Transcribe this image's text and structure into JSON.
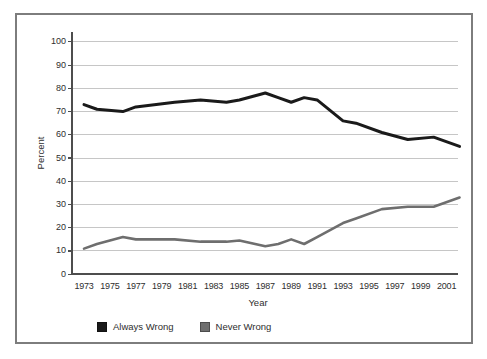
{
  "colors": {
    "background": "#ffffff",
    "frame_border": "#7d7d7d",
    "gridline": "#c6c6c6",
    "axis": "#4d4d4d",
    "text": "#2e2e2e"
  },
  "chart_data": {
    "type": "line",
    "xlabel": "Year",
    "ylabel": "Percent",
    "x_tick_labels": [
      "1973",
      "1975",
      "1977",
      "1979",
      "1981",
      "1983",
      "1985",
      "1987",
      "1989",
      "1991",
      "1993",
      "1995",
      "1997",
      "1999",
      "2001"
    ],
    "y_ticks": [
      0,
      10,
      20,
      30,
      40,
      50,
      60,
      70,
      80,
      90,
      100
    ],
    "ylim": [
      0,
      100
    ],
    "xlim": [
      1973,
      2002
    ],
    "grid": "horizontal",
    "legend_position": "bottom-left",
    "x": [
      1973,
      1974,
      1976,
      1977,
      1980,
      1982,
      1984,
      1985,
      1987,
      1988,
      1989,
      1990,
      1991,
      1993,
      1994,
      1996,
      1998,
      2000,
      2002
    ],
    "series": [
      {
        "name": "Always Wrong",
        "color": "#1a1a1a",
        "width": 3,
        "values": [
          73,
          71,
          70,
          72,
          74,
          75,
          74,
          75,
          78,
          76,
          74,
          76,
          75,
          66,
          65,
          61,
          58,
          59,
          55
        ]
      },
      {
        "name": "Never Wrong",
        "color": "#6e6e6e",
        "width": 2.6,
        "values": [
          11,
          13,
          16,
          15,
          15,
          14,
          14,
          14.5,
          12,
          13,
          15,
          13,
          16,
          22,
          24,
          28,
          29,
          29,
          33
        ]
      }
    ]
  }
}
